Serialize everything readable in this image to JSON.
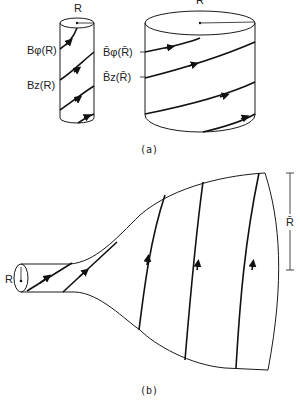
{
  "figure": {
    "panel_a": {
      "caption": "(a)",
      "small_cylinder": {
        "radius_label": "R",
        "labels": [
          "Bφ(R)",
          "Bz(R)"
        ]
      },
      "large_cylinder": {
        "radius_label": "R̄",
        "labels": [
          "B̄φ(R̄)",
          "B̄z(R̄)"
        ]
      }
    },
    "panel_b": {
      "caption": "(b)",
      "inlet_radius_label": "R",
      "outlet_radius_label": "R̄"
    },
    "colors": {
      "ink": "#111111",
      "background": "#ffffff"
    }
  }
}
